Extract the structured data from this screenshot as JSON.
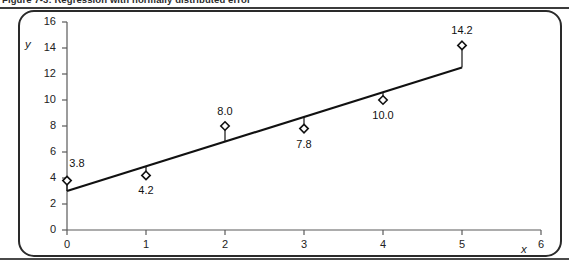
{
  "caption": {
    "text": "Figure 7-3: Regression with normally distributed error"
  },
  "chart_data": {
    "type": "scatter",
    "title": "",
    "subtitle": "",
    "xlabel": "x",
    "ylabel": "y",
    "xlim": [
      0,
      6
    ],
    "ylim": [
      0,
      16
    ],
    "xticks": [
      "0",
      "1",
      "2",
      "3",
      "4",
      "5",
      "6"
    ],
    "yticks": [
      "0",
      "2",
      "4",
      "6",
      "8",
      "10",
      "12",
      "14",
      "16"
    ],
    "grid": false,
    "legend": null,
    "marker_style": "open-diamond",
    "x": [
      0,
      1,
      2,
      3,
      4,
      5
    ],
    "y": [
      3.8,
      4.2,
      8.0,
      7.8,
      10.0,
      14.2
    ],
    "point_labels": [
      "3.8",
      "4.2",
      "8.0",
      "7.8",
      "10.0",
      "14.2"
    ],
    "point_label_positions": [
      "above-left",
      "below",
      "above",
      "below",
      "below",
      "above"
    ],
    "series": [
      {
        "name": "observations",
        "values": [
          3.8,
          4.2,
          8.0,
          7.8,
          10.0,
          14.2
        ]
      },
      {
        "name": "regression-line",
        "type": "line",
        "x": [
          0,
          5
        ],
        "y": [
          3.0,
          12.5
        ]
      }
    ],
    "residuals": {
      "description": "vertical connector from each observed point to the fitted line",
      "fitted": [
        3.0,
        4.9,
        6.8,
        8.7,
        10.6,
        12.5
      ]
    },
    "colors": {
      "line": "#111111",
      "marker_fill": "#ffffff",
      "marker_stroke": "#111111",
      "axis": "#5a5a5a",
      "frame": "#2a2a2a",
      "background": "#ffffff"
    }
  }
}
